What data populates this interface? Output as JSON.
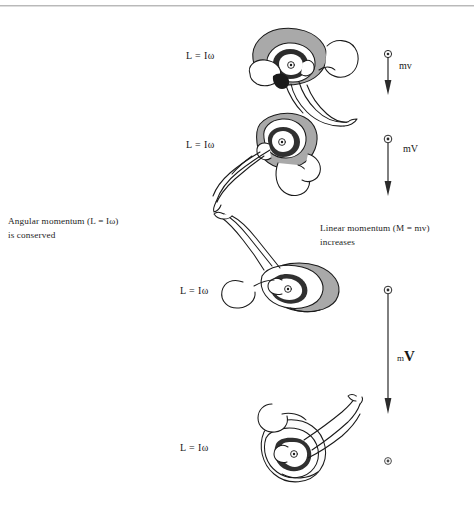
{
  "page": {
    "width": 474,
    "height": 508,
    "background": "#ffffff",
    "rule_color": "#b9b9b9",
    "ink_color": "#1a1a1a",
    "shade_color": "#9a9a9a"
  },
  "captions": {
    "left": {
      "name": "angular-momentum-caption",
      "line1": "Angular momentum (L  =  Iω)",
      "line2": "is conserved"
    },
    "right": {
      "name": "linear-momentum-caption",
      "line1": "Linear momentum (M  =  mv)",
      "line2": "increases"
    }
  },
  "equation_labels": [
    {
      "text": "L  =  Iω",
      "x": 186,
      "y": 50
    },
    {
      "text": "L  =  Iω",
      "x": 186,
      "y": 139
    },
    {
      "text": "L  =  Iω",
      "x": 180,
      "y": 285
    },
    {
      "text": "L  =  Iω",
      "x": 180,
      "y": 442
    }
  ],
  "momentum_vectors": [
    {
      "label": "mv",
      "label_html": "mv",
      "style": "small",
      "x": 387,
      "y_top": 52,
      "length": 38,
      "label_x": 399,
      "label_y": 66
    },
    {
      "label": "mV",
      "label_html": "mV",
      "style": "medium",
      "x": 387,
      "y_top": 137,
      "length": 58,
      "label_x": 403,
      "label_y": 148
    },
    {
      "label": "mV",
      "label_html": "mV",
      "style": "large",
      "x": 387,
      "y_top": 288,
      "length": 126,
      "label_x": 398,
      "label_y": 357
    }
  ],
  "terminal_marker": {
    "name": "center-of-mass-dot",
    "x": 387,
    "y": 456
  },
  "figures": [
    {
      "name": "diver-figure-tight-tuck",
      "position": 1,
      "shaded": true,
      "description": "tight tuck"
    },
    {
      "name": "diver-figure-opening-tuck",
      "position": 2,
      "shaded": true,
      "description": "opening tuck"
    },
    {
      "name": "diver-figure-pike",
      "position": 3,
      "shaded": true,
      "description": "pike / legs extended"
    },
    {
      "name": "diver-figure-layout",
      "position": 4,
      "shaded": false,
      "description": "layout / extended"
    }
  ]
}
